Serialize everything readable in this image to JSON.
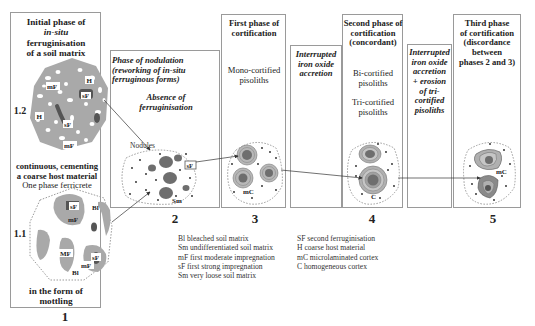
{
  "panel1": {
    "title_line1": "Initial phase of",
    "title_line2": "in-situ",
    "title_line3": "ferruginisation",
    "title_line4": "of a soil matrix",
    "sub12_label": "1.2",
    "sub11_label": "1.1",
    "middle_line1": "continuous, cementing",
    "middle_line2": "a coarse host material",
    "middle_line3": "One phase ferricrete",
    "bottom_line1": "in the form of",
    "bottom_line2": "mottling",
    "number": "1",
    "labels_12": [
      "H",
      "mF",
      "sF",
      "H",
      "sF",
      "mF"
    ],
    "labels_11": [
      "sF",
      "Bl",
      "mF",
      "MF",
      "sF",
      "mF",
      "Bl"
    ]
  },
  "panel2": {
    "title_line1": "Phase of nodulation",
    "title_line2": "(reworking of in-situ",
    "title_line3": "ferruginous forms)",
    "sub_line1": "Absence of",
    "sub_line2": "ferruginisation",
    "nodules_label": "Nodules",
    "sf_label": "sF",
    "sm_label": "Sm",
    "number": "2"
  },
  "panel3": {
    "title_line1": "First phase of",
    "title_line2": "cortification",
    "desc_line1": "Mono-cortified",
    "desc_line2": "pisoliths",
    "mc_label": "mC",
    "number": "3"
  },
  "interrupted1": {
    "line1": "Interrupted",
    "line2": "iron oxide",
    "line3": "accretion"
  },
  "panel4": {
    "title_line1": "Second phase of",
    "title_line2": "cortification",
    "title_line3": "(concordant)",
    "desc1_line1": "Bi-cortified",
    "desc1_line2": "pisoliths",
    "desc2_line1": "Tri-cortified",
    "desc2_line2": "pisoliths",
    "c_label": "C",
    "number": "4"
  },
  "interrupted2": {
    "line1": "Interrupted",
    "line2": "iron oxide",
    "line3": "accretion",
    "line4": "+ erosion",
    "line5": "of tri-",
    "line6": "cortified",
    "line7": "pisoliths"
  },
  "panel5": {
    "title_line1": "Third phase",
    "title_line2": "of cortification",
    "title_line3": "(discordance",
    "title_line4": "between",
    "title_line5": "phases 2 and 3)",
    "mc_label": "mC",
    "number": "5"
  },
  "legend": {
    "left": [
      "Bl bleached soil matrix",
      "Sm undifferentiated soil matrix",
      "mF first moderate impregnation",
      "sF first strong impregnation",
      "Sm very loose soil matrix"
    ],
    "right": [
      "SF second ferruginisation",
      "H coarse host material",
      "mC microlaminated cortex",
      "C homogeneous cortex"
    ]
  },
  "colors": {
    "matrix_gray": "#a9a9a9",
    "dark_nodule": "#6e6e6e",
    "darkest": "#3c3c3c",
    "box_border": "#9a9a9a",
    "dotted_outline": "#9a9a9a"
  }
}
